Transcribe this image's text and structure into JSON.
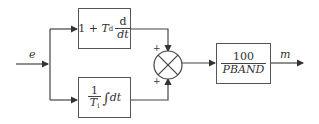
{
  "diagram": {
    "type": "block-diagram",
    "input": {
      "label": "e"
    },
    "output": {
      "label": "m"
    },
    "blocks": [
      {
        "id": "derivative",
        "expression": "1 + Td d/dt",
        "parts": {
          "lead": "1 + ",
          "var": "T",
          "sub": "d",
          "num": "d",
          "den": "dt"
        }
      },
      {
        "id": "integral",
        "expression": "(1/Ti) ∫ dt",
        "parts": {
          "num": "1",
          "var": "T",
          "sub": "i",
          "integral": "∫",
          "tail": "dt"
        }
      },
      {
        "id": "gain",
        "expression": "100 / PBAND",
        "parts": {
          "num": "100",
          "den": "PBAND"
        }
      }
    ],
    "summing_junction": {
      "id": "sum",
      "inputs": [
        {
          "from": "derivative",
          "sign": "+"
        },
        {
          "from": "integral",
          "sign": "+"
        }
      ]
    },
    "connections": [
      {
        "from": "input",
        "to": "derivative"
      },
      {
        "from": "input",
        "to": "integral"
      },
      {
        "from": "derivative",
        "to": "sum"
      },
      {
        "from": "integral",
        "to": "sum"
      },
      {
        "from": "sum",
        "to": "gain"
      },
      {
        "from": "gain",
        "to": "output"
      }
    ],
    "colors": {
      "line": "#444444",
      "background": "#ffffff",
      "text": "#333333"
    }
  }
}
